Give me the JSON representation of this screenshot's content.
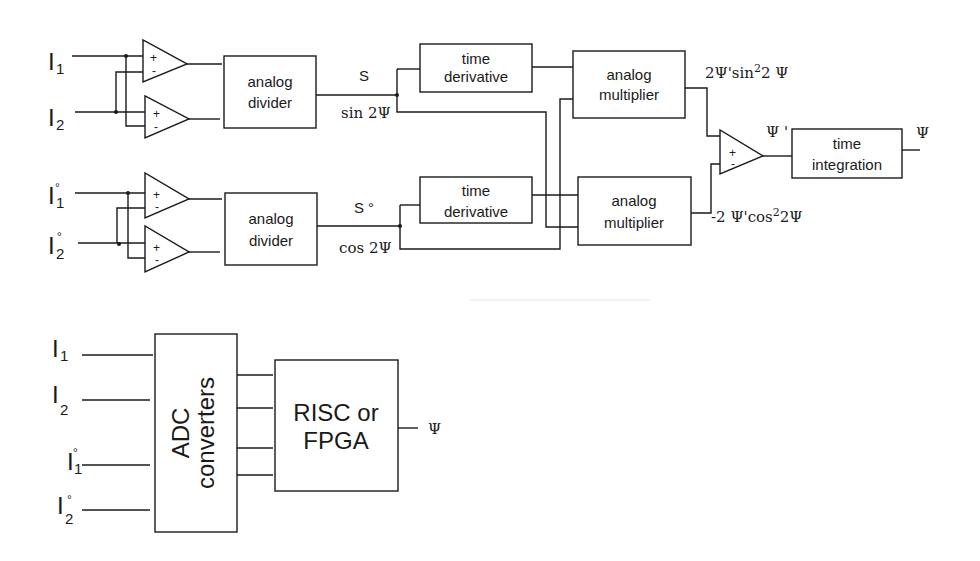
{
  "diagram": {
    "analog_chain": {
      "inputs": [
        {
          "letter": "I",
          "sub": "1",
          "ring": ""
        },
        {
          "letter": "I",
          "sub": "2",
          "ring": ""
        },
        {
          "letter": "I",
          "sub": "1",
          "ring": "°"
        },
        {
          "letter": "I",
          "sub": "2",
          "ring": "°"
        }
      ],
      "opamp_signs": {
        "plus": "+",
        "minus": "-"
      },
      "divider_top": [
        "analog",
        "divider"
      ],
      "divider_bottom": [
        "analog",
        "divider"
      ],
      "signal_S": "S",
      "signal_sin": "sin 2Ψ",
      "signal_S0": "S °",
      "signal_cos": "cos 2Ψ",
      "derivative_top": [
        "time",
        "derivative"
      ],
      "derivative_bottom": [
        "time",
        "derivative"
      ],
      "multiplier_top": [
        "analog",
        "multiplier"
      ],
      "multiplier_bottom": [
        "analog",
        "multiplier"
      ],
      "product_top": {
        "pre": "2Ψ'sin",
        "sup": "2",
        "post": "2 Ψ"
      },
      "product_bottom": {
        "pre": "-2 Ψ'cos",
        "sup": "2",
        "post": "2Ψ"
      },
      "psi_prime": "Ψ '",
      "integrator": [
        "time",
        "integration"
      ],
      "output": "Ψ"
    },
    "digital_chain": {
      "inputs": [
        {
          "letter": "I",
          "sub": "1",
          "ring": ""
        },
        {
          "letter": "I",
          "sub": "2",
          "ring": ""
        },
        {
          "letter": "I",
          "sub": "1",
          "ring": "°"
        },
        {
          "letter": "I",
          "sub": "2",
          "ring": "°"
        }
      ],
      "adc": [
        "ADC",
        "converters"
      ],
      "processor": [
        "RISC or",
        "FPGA"
      ],
      "output": "Ψ"
    }
  }
}
